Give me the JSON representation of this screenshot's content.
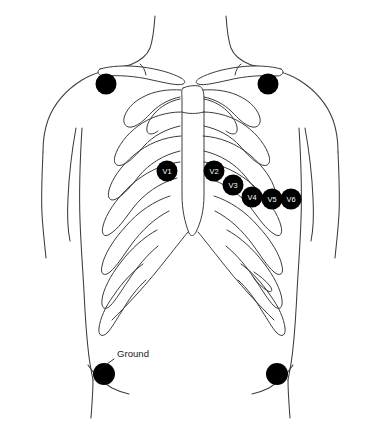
{
  "figure": {
    "background_color": "#ffffff",
    "outline_color": "#3c3c3c",
    "electrode_color": "#000000",
    "electrode_label_color": "#ffffff",
    "annotation_color": "#1a1a1a",
    "width": 381,
    "height": 424
  },
  "electrodes": {
    "precordial": [
      {
        "id": "v1",
        "label": "V1",
        "cx": 167,
        "cy": 171,
        "r": 10.5
      },
      {
        "id": "v2",
        "label": "V2",
        "cx": 214,
        "cy": 171,
        "r": 10.5
      },
      {
        "id": "v3",
        "label": "V3",
        "cx": 233,
        "cy": 185,
        "r": 10.5
      },
      {
        "id": "v4",
        "label": "V4",
        "cx": 252,
        "cy": 197,
        "r": 10.5
      },
      {
        "id": "v5",
        "label": "V5",
        "cx": 272,
        "cy": 199,
        "r": 10.5
      },
      {
        "id": "v6",
        "label": "V6",
        "cx": 291,
        "cy": 199,
        "r": 10.5
      }
    ],
    "limb": [
      {
        "id": "right-arm",
        "label": "",
        "cx": 106,
        "cy": 84,
        "r": 10.5
      },
      {
        "id": "left-arm",
        "label": "",
        "cx": 268,
        "cy": 84,
        "r": 10.5
      },
      {
        "id": "ground",
        "label": "",
        "cx": 104,
        "cy": 374,
        "r": 11.0
      },
      {
        "id": "left-leg",
        "label": "",
        "cx": 277,
        "cy": 374,
        "r": 11.0
      }
    ]
  },
  "annotations": [
    {
      "id": "ground-callout",
      "text": "Ground",
      "text_x": 117,
      "text_y": 357,
      "leader_x1": 114,
      "leader_y1": 359,
      "leader_x2": 100,
      "leader_y2": 369
    }
  ]
}
